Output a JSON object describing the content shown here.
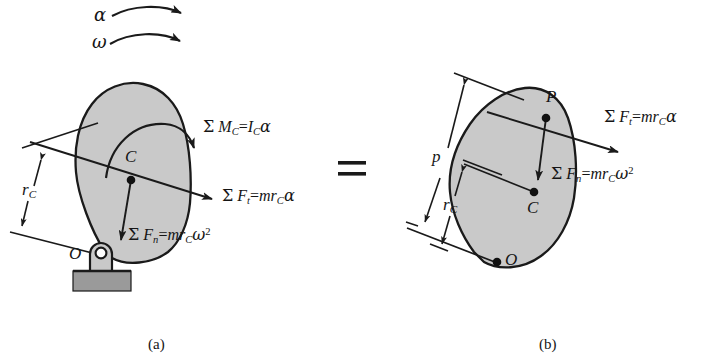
{
  "figure": {
    "equals_sign": "=",
    "colors": {
      "body_fill": "#c9c9c9",
      "body_stroke": "#1a1a1a",
      "ground_fill": "#9a9a9a",
      "line": "#1a1a1a",
      "text": "#151515"
    }
  },
  "panel_a": {
    "caption": "(a)",
    "rotation": {
      "alpha_symbol": "α",
      "omega_symbol": "ω"
    },
    "points": {
      "center_of_mass": "C",
      "pivot": "O"
    },
    "dimensions": {
      "r_c_symbol": "r",
      "r_c_subscript": "C"
    },
    "equations": {
      "moment": {
        "sigma": "Σ",
        "lhs_var": "M",
        "lhs_sub": "C",
        "eq": "=",
        "rhs_var": "I",
        "rhs_sub": "C",
        "rhs_greek": "α",
        "plain": "Σ M_C = I_C α"
      },
      "tangential_force": {
        "sigma": "Σ",
        "lhs_var": "F",
        "lhs_sub": "t",
        "eq": "=",
        "rhs_m": "mr",
        "rhs_sub": "C",
        "rhs_greek": "α",
        "plain": "Σ F_t = mr_C α"
      },
      "normal_force": {
        "sigma": "Σ",
        "lhs_var": "F",
        "lhs_sub": "n",
        "eq": "=",
        "rhs_m": "mr",
        "rhs_sub": "C",
        "rhs_greek": "ω",
        "rhs_exp": "2",
        "plain": "Σ F_n = mr_C ω²"
      }
    }
  },
  "panel_b": {
    "caption": "(b)",
    "points": {
      "percussion": "P",
      "center_of_mass": "C",
      "pivot": "O"
    },
    "dimensions": {
      "p_symbol": "p",
      "r_c_symbol": "r",
      "r_c_subscript": "C"
    },
    "equations": {
      "tangential_force": {
        "sigma": "Σ",
        "lhs_var": "F",
        "lhs_sub": "t",
        "eq": "=",
        "rhs_m": "mr",
        "rhs_sub": "C",
        "rhs_greek": "α",
        "plain": "Σ F_t = mr_C α"
      },
      "normal_force": {
        "sigma": "Σ",
        "lhs_var": "F",
        "lhs_sub": "n",
        "eq": "=",
        "rhs_m": "mr",
        "rhs_sub": "C",
        "rhs_greek": "ω",
        "rhs_exp": "2",
        "plain": "Σ F_n = mr_C ω²"
      }
    }
  }
}
